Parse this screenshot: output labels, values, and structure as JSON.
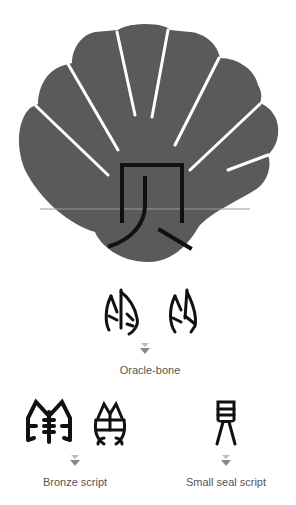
{
  "title_character": "贝",
  "shell_color": "#5a5a5a",
  "glyph_color": "#111111",
  "arrow_color": "#888888",
  "label_color": "#555555",
  "stages": [
    {
      "label": "Oracle-bone",
      "glyph_count": 2
    },
    {
      "label": "Bronze script",
      "glyph_count": 2
    },
    {
      "label": "Small seal script",
      "glyph_count": 1
    }
  ],
  "icons": {
    "arrow": "double-down-arrow-icon"
  }
}
